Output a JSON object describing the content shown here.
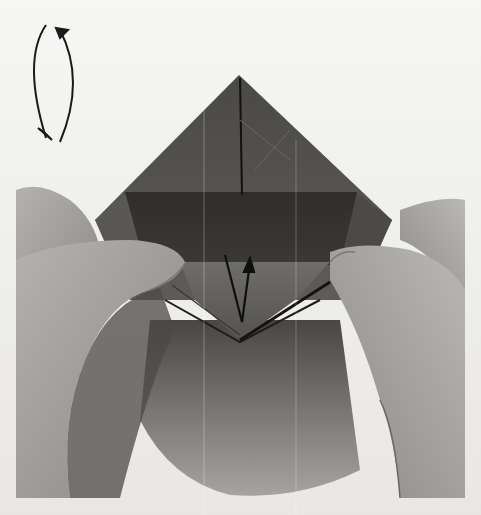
{
  "image": {
    "description": "Origami instruction photo: hands holding a folded square model, with turn-over symbol and fold arrow",
    "turn_over_symbol": "turn-over-arrows",
    "fold_arrow": "valley-fold-up-arrow"
  },
  "colors": {
    "background": "#f4f4f2",
    "paper_light": "#6a6864",
    "paper_dark": "#2e2d2b",
    "skin": "#a9a7a3",
    "skin_shadow": "#6e6c68",
    "arrow": "#1a1a1a"
  }
}
